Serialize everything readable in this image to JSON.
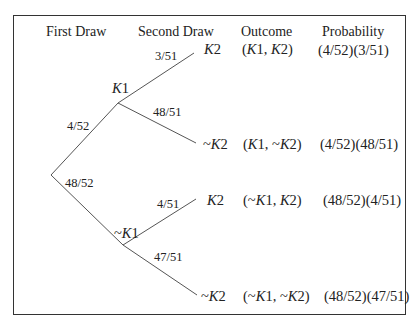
{
  "diagram": {
    "type": "probability-tree",
    "headers": {
      "first_draw": "First Draw",
      "second_draw": "Second Draw",
      "outcome": "Outcome",
      "probability": "Probability"
    },
    "first_level": {
      "k1": {
        "label_italic": "K",
        "label_suffix": "1",
        "prefix": "",
        "branch_prob": "4/52"
      },
      "not_k1": {
        "label_italic": "K",
        "label_suffix": "1",
        "prefix": "~",
        "branch_prob": "48/52"
      }
    },
    "second_level": [
      {
        "parent": "K1",
        "prefix": "",
        "label_italic": "K",
        "label_suffix": "2",
        "branch_prob": "3/51",
        "outcome": "(K1, K2)",
        "probability": "(4/52)(3/51)"
      },
      {
        "parent": "K1",
        "prefix": "~",
        "label_italic": "K",
        "label_suffix": "2",
        "branch_prob": "48/51",
        "outcome": "(K1, ~K2)",
        "probability": "(4/52)(48/51)"
      },
      {
        "parent": "~K1",
        "prefix": "",
        "label_italic": "K",
        "label_suffix": "2",
        "branch_prob": "4/51",
        "outcome": "(~K1, K2)",
        "probability": "(48/52)(4/51)"
      },
      {
        "parent": "~K1",
        "prefix": "~",
        "label_italic": "K",
        "label_suffix": "2",
        "branch_prob": "47/51",
        "outcome": "(~K1, ~K2)",
        "probability": "(48/52)(47/51)"
      }
    ],
    "outcome_parts": [
      {
        "open": "(",
        "a_prefix": "",
        "a": "K",
        "a_suf": "1",
        "sep": ", ",
        "b_prefix": "",
        "b": "K",
        "b_suf": "2",
        "close": ")"
      },
      {
        "open": "(",
        "a_prefix": "",
        "a": "K",
        "a_suf": "1",
        "sep": ", ",
        "b_prefix": "~",
        "b": "K",
        "b_suf": "2",
        "close": ")"
      },
      {
        "open": "(",
        "a_prefix": "~",
        "a": "K",
        "a_suf": "1",
        "sep": ", ",
        "b_prefix": "",
        "b": "K",
        "b_suf": "2",
        "close": ")"
      },
      {
        "open": "(",
        "a_prefix": "~",
        "a": "K",
        "a_suf": "1",
        "sep": ", ",
        "b_prefix": "~",
        "b": "K",
        "b_suf": "2",
        "close": ")"
      }
    ],
    "colors": {
      "line": "#555555",
      "text": "#222222",
      "border": "#333333"
    }
  }
}
